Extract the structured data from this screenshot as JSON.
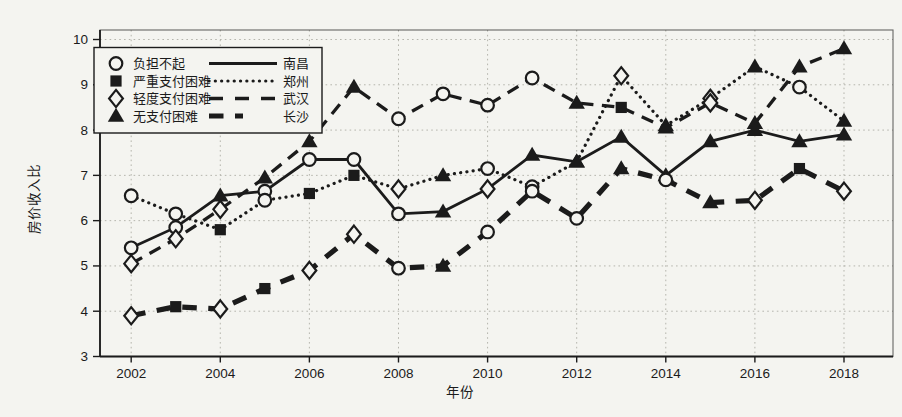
{
  "figure": {
    "xlabel": "年份",
    "ylabel": "房价收入比",
    "colors": {
      "ink": "#1b1b1b",
      "paper": "#f4f4f0",
      "grid": "#b5b5ad"
    }
  },
  "legend": {
    "marker_entries": [
      {
        "marker": "circle",
        "label": "负担不起"
      },
      {
        "marker": "square",
        "label": "严重支付困难"
      },
      {
        "marker": "diamond",
        "label": "轻度支付困难"
      },
      {
        "marker": "triangle",
        "label": "无支付困难"
      }
    ],
    "line_entries": [
      {
        "line": "solid",
        "label": "南昌"
      },
      {
        "line": "dotted",
        "label": "郑州"
      },
      {
        "line": "dashed",
        "label": "武汉"
      },
      {
        "line": "thick-dashed",
        "label": "长沙"
      }
    ]
  },
  "chart_data": {
    "type": "line",
    "title": "",
    "xlabel": "年份",
    "ylabel": "房价收入比",
    "grid": true,
    "legend_position": "upper-left",
    "x": [
      2002,
      2003,
      2004,
      2005,
      2006,
      2007,
      2008,
      2009,
      2010,
      2011,
      2012,
      2013,
      2014,
      2015,
      2016,
      2017,
      2018
    ],
    "xticks": [
      2002,
      2004,
      2006,
      2008,
      2010,
      2012,
      2014,
      2016,
      2018
    ],
    "yticks": [
      3,
      4,
      5,
      6,
      7,
      8,
      9,
      10
    ],
    "xlim": [
      2001.3,
      2019.1
    ],
    "ylim": [
      3,
      10.21
    ],
    "series": [
      {
        "name": "南昌",
        "line": "solid",
        "values": [
          5.4,
          5.85,
          6.55,
          6.65,
          7.35,
          7.35,
          6.15,
          6.2,
          6.7,
          7.45,
          7.3,
          7.85,
          7.0,
          7.75,
          8.0,
          7.75,
          7.9
        ],
        "markers": [
          "circle",
          "circle",
          "triangle",
          "circle",
          "circle",
          "circle",
          "circle",
          "triangle",
          "diamond",
          "triangle",
          "triangle",
          "triangle",
          "triangle",
          "triangle",
          "triangle",
          "triangle",
          "triangle"
        ]
      },
      {
        "name": "郑州",
        "line": "dotted",
        "values": [
          6.55,
          6.15,
          5.8,
          6.45,
          6.6,
          7.0,
          6.7,
          7.0,
          7.15,
          6.75,
          7.3,
          9.2,
          8.1,
          8.7,
          9.4,
          8.95,
          8.2
        ],
        "markers": [
          "circle",
          "circle",
          "square",
          "circle",
          "square",
          "square",
          "diamond",
          "triangle",
          "circle",
          "circle",
          "triangle",
          "diamond",
          "triangle",
          "diamond",
          "triangle",
          "circle",
          "triangle"
        ]
      },
      {
        "name": "武汉",
        "line": "dashed",
        "values": [
          5.05,
          5.6,
          6.25,
          6.95,
          7.75,
          8.95,
          8.25,
          8.8,
          8.55,
          9.15,
          8.6,
          8.5,
          8.05,
          8.6,
          8.15,
          9.4,
          9.8
        ],
        "markers": [
          "diamond",
          "diamond",
          "diamond",
          "triangle",
          "triangle",
          "triangle",
          "circle",
          "circle",
          "circle",
          "circle",
          "triangle",
          "square",
          "triangle",
          "diamond",
          "triangle",
          "triangle",
          "triangle"
        ]
      },
      {
        "name": "长沙",
        "line": "thick-dashed",
        "values": [
          3.9,
          4.1,
          4.05,
          4.5,
          4.9,
          5.7,
          4.95,
          5.0,
          5.75,
          6.65,
          6.05,
          7.15,
          6.9,
          6.4,
          6.45,
          7.15,
          6.65
        ],
        "markers": [
          "diamond",
          "square",
          "diamond",
          "square",
          "diamond",
          "diamond",
          "circle",
          "triangle",
          "circle",
          "circle",
          "circle",
          "triangle",
          "circle",
          "triangle",
          "diamond",
          "square",
          "diamond"
        ]
      }
    ]
  }
}
